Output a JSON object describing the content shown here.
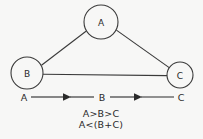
{
  "diagram": {
    "background_color": "#f7f7f6",
    "stroke_color": "#3a3a3a",
    "text_color": "#2a2a2a",
    "nodes": [
      {
        "id": "A",
        "label": "A",
        "cx": 101,
        "cy": 22,
        "r": 17
      },
      {
        "id": "B",
        "label": "B",
        "cx": 27,
        "cy": 73,
        "r": 16
      },
      {
        "id": "C",
        "label": "C",
        "cx": 180,
        "cy": 75,
        "r": 13
      }
    ],
    "edges": [
      {
        "from": "B",
        "to": "A"
      },
      {
        "from": "A",
        "to": "C"
      },
      {
        "from": "B",
        "to": "C"
      }
    ],
    "sequence": {
      "items": [
        {
          "label": "A",
          "x": 24,
          "y": 97
        },
        {
          "label": "B",
          "x": 102,
          "y": 97
        },
        {
          "label": "C",
          "x": 181,
          "y": 97
        }
      ],
      "arrows": [
        {
          "from": "A",
          "to": "B",
          "x1": 31,
          "x2": 94,
          "y": 97
        },
        {
          "from": "B",
          "to": "C",
          "x1": 110,
          "x2": 174,
          "y": 97
        }
      ]
    },
    "formulas": [
      {
        "text": "A>B>C",
        "x": 101,
        "y": 113
      },
      {
        "text": "A<(B+C)",
        "x": 101,
        "y": 124
      }
    ]
  }
}
